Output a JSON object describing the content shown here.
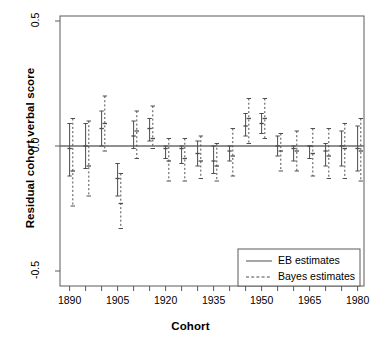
{
  "chart_data": {
    "type": "line",
    "title": "",
    "xlabel": "Cohort",
    "ylabel": "Residual cohort verbal score",
    "xlim": [
      1887,
      1982
    ],
    "ylim": [
      -0.56,
      0.52
    ],
    "xticks": [
      1890,
      1895,
      1900,
      1905,
      1910,
      1915,
      1920,
      1925,
      1930,
      1935,
      1940,
      1945,
      1950,
      1955,
      1960,
      1965,
      1970,
      1975,
      1980
    ],
    "xtick_labels": [
      "1890",
      "",
      "",
      "1905",
      "",
      "",
      "1920",
      "",
      "",
      "1935",
      "",
      "",
      "1950",
      "",
      "",
      "1965",
      "",
      "",
      "1980"
    ],
    "yticks": [
      0.5,
      0.0,
      -0.5
    ],
    "ytick_labels": [
      "0.5",
      "0.0",
      "-0.5"
    ],
    "grid": false,
    "reference_line_y": 0.0,
    "legend_position": "bottom-right",
    "series": [
      {
        "name": "EB estimates",
        "style": "solid",
        "color": "#4d4d4d",
        "points": [
          {
            "x": 1890,
            "estimate": -0.01,
            "lower": -0.12,
            "upper": 0.09
          },
          {
            "x": 1895,
            "estimate": 0.0,
            "lower": -0.09,
            "upper": 0.09
          },
          {
            "x": 1900,
            "estimate": 0.07,
            "lower": 0.0,
            "upper": 0.14
          },
          {
            "x": 1905,
            "estimate": -0.13,
            "lower": -0.2,
            "upper": -0.07
          },
          {
            "x": 1910,
            "estimate": 0.04,
            "lower": -0.01,
            "upper": 0.1
          },
          {
            "x": 1915,
            "estimate": 0.07,
            "lower": 0.02,
            "upper": 0.11
          },
          {
            "x": 1920,
            "estimate": -0.01,
            "lower": -0.05,
            "upper": 0.0
          },
          {
            "x": 1925,
            "estimate": -0.01,
            "lower": -0.07,
            "upper": 0.0
          },
          {
            "x": 1930,
            "estimate": -0.03,
            "lower": -0.08,
            "upper": 0.02
          },
          {
            "x": 1935,
            "estimate": -0.06,
            "lower": -0.11,
            "upper": 0.0
          },
          {
            "x": 1940,
            "estimate": -0.02,
            "lower": -0.06,
            "upper": 0.0
          },
          {
            "x": 1945,
            "estimate": 0.08,
            "lower": 0.04,
            "upper": 0.13
          },
          {
            "x": 1950,
            "estimate": 0.09,
            "lower": 0.05,
            "upper": 0.13
          },
          {
            "x": 1955,
            "estimate": 0.0,
            "lower": -0.04,
            "upper": 0.04
          },
          {
            "x": 1960,
            "estimate": -0.01,
            "lower": -0.06,
            "upper": 0.0
          },
          {
            "x": 1965,
            "estimate": 0.0,
            "lower": -0.05,
            "upper": 0.0
          },
          {
            "x": 1970,
            "estimate": -0.02,
            "lower": -0.08,
            "upper": 0.01
          },
          {
            "x": 1975,
            "estimate": 0.0,
            "lower": -0.08,
            "upper": 0.06
          },
          {
            "x": 1980,
            "estimate": -0.01,
            "lower": -0.1,
            "upper": 0.08
          }
        ]
      },
      {
        "name": "Bayes estimates",
        "style": "dashed",
        "color": "#4d4d4d",
        "points": [
          {
            "x": 1891,
            "estimate": -0.1,
            "lower": -0.24,
            "upper": 0.11
          },
          {
            "x": 1896,
            "estimate": -0.08,
            "lower": -0.2,
            "upper": 0.1
          },
          {
            "x": 1901,
            "estimate": 0.09,
            "lower": -0.02,
            "upper": 0.2
          },
          {
            "x": 1906,
            "estimate": -0.23,
            "lower": -0.33,
            "upper": -0.11
          },
          {
            "x": 1911,
            "estimate": 0.06,
            "lower": -0.05,
            "upper": 0.14
          },
          {
            "x": 1916,
            "estimate": 0.03,
            "lower": -0.01,
            "upper": 0.16
          },
          {
            "x": 1921,
            "estimate": -0.06,
            "lower": -0.14,
            "upper": 0.03
          },
          {
            "x": 1926,
            "estimate": -0.05,
            "lower": -0.14,
            "upper": 0.03
          },
          {
            "x": 1931,
            "estimate": -0.06,
            "lower": -0.13,
            "upper": 0.04
          },
          {
            "x": 1936,
            "estimate": -0.08,
            "lower": -0.14,
            "upper": 0.01
          },
          {
            "x": 1941,
            "estimate": -0.04,
            "lower": -0.12,
            "upper": 0.07
          },
          {
            "x": 1946,
            "estimate": 0.11,
            "lower": 0.01,
            "upper": 0.19
          },
          {
            "x": 1951,
            "estimate": 0.11,
            "lower": 0.03,
            "upper": 0.19
          },
          {
            "x": 1956,
            "estimate": -0.02,
            "lower": -0.1,
            "upper": 0.05
          },
          {
            "x": 1961,
            "estimate": -0.02,
            "lower": -0.1,
            "upper": 0.06
          },
          {
            "x": 1966,
            "estimate": -0.03,
            "lower": -0.12,
            "upper": 0.07
          },
          {
            "x": 1971,
            "estimate": -0.04,
            "lower": -0.13,
            "upper": 0.07
          },
          {
            "x": 1976,
            "estimate": -0.01,
            "lower": -0.13,
            "upper": 0.09
          },
          {
            "x": 1981,
            "estimate": -0.02,
            "lower": -0.14,
            "upper": 0.11
          }
        ]
      }
    ]
  },
  "legend": {
    "entries": [
      {
        "label": "EB estimates",
        "style": "solid"
      },
      {
        "label": "Bayes estimates",
        "style": "dashed"
      }
    ]
  }
}
